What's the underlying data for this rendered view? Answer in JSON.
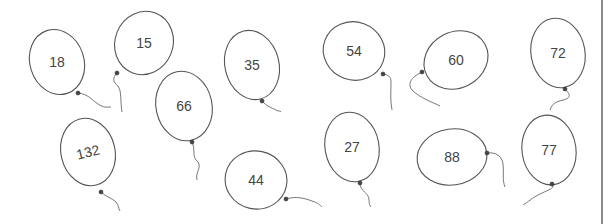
{
  "scene": {
    "description": "Hand-drawn balloons each labeled with a number",
    "outline_color": "#555555",
    "text_color": "#444444"
  },
  "balloons": [
    {
      "label": "18",
      "cx": 57,
      "cy": 62,
      "rx": 27,
      "ry": 33,
      "rot": -18,
      "knot": [
        78,
        93
      ],
      "string": "M78,93 C88,94 92,100 98,104 C104,108 106,107 111,107"
    },
    {
      "label": "15",
      "cx": 144,
      "cy": 43,
      "rx": 29,
      "ry": 32,
      "rot": 22,
      "knot": [
        117,
        73
      ],
      "string": "M117,73 C112,78 113,82 118,86 C122,92 120,100 122,112"
    },
    {
      "label": "66",
      "cx": 184,
      "cy": 106,
      "rx": 28,
      "ry": 35,
      "rot": -12,
      "knot": [
        192,
        142
      ],
      "string": "M192,142 C196,150 191,156 198,162 C202,168 195,172 197,180"
    },
    {
      "label": "35",
      "cx": 252,
      "cy": 65,
      "rx": 27,
      "ry": 35,
      "rot": -14,
      "knot": [
        262,
        101
      ],
      "string": "M262,101 C266,106 272,108 276,110 C279,112 280,110 281,112"
    },
    {
      "label": "54",
      "cx": 354,
      "cy": 51,
      "rx": 31,
      "ry": 29,
      "rot": 20,
      "knot": [
        383,
        74
      ],
      "string": "M383,74 C388,75 391,76 391,82 C391,92 390,100 392,110"
    },
    {
      "label": "60",
      "cx": 456,
      "cy": 60,
      "rx": 33,
      "ry": 28,
      "rot": -28,
      "knot": [
        422,
        72
      ],
      "string": "M422,72 C414,76 406,82 412,90 C420,98 432,102 440,106"
    },
    {
      "label": "72",
      "cx": 558,
      "cy": 53,
      "rx": 27,
      "ry": 35,
      "rot": -10,
      "knot": [
        565,
        89
      ],
      "string": "M565,89 C570,94 572,98 563,100 C555,102 552,104 550,110"
    },
    {
      "label": "132",
      "cx": 88,
      "cy": 152,
      "rx": 27,
      "ry": 34,
      "rot": -14,
      "knot": [
        101,
        192
      ],
      "string": "M101,192 C106,197 112,198 116,202 C119,205 118,208 120,211"
    },
    {
      "label": "44",
      "cx": 256,
      "cy": 180,
      "rx": 31,
      "ry": 29,
      "rot": 12,
      "knot": [
        286,
        199
      ],
      "string": "M286,199 C296,196 304,198 312,201 C318,203 320,205 322,207"
    },
    {
      "label": "27",
      "cx": 352,
      "cy": 147,
      "rx": 27,
      "ry": 35,
      "rot": -10,
      "knot": [
        360,
        183
      ],
      "string": "M360,183 C360,190 366,192 368,196 C370,200 368,204 371,207"
    },
    {
      "label": "88",
      "cx": 452,
      "cy": 157,
      "rx": 35,
      "ry": 28,
      "rot": -8,
      "knot": [
        487,
        153
      ],
      "string": "M487,153 C496,152 502,156 503,164 C504,172 502,180 505,187"
    },
    {
      "label": "77",
      "cx": 549,
      "cy": 150,
      "rx": 27,
      "ry": 35,
      "rot": -8,
      "knot": [
        552,
        184
      ],
      "string": "M552,184 C556,188 548,190 540,194 C532,198 528,202 523,205"
    }
  ],
  "label_rotations": {
    "132": -14
  }
}
